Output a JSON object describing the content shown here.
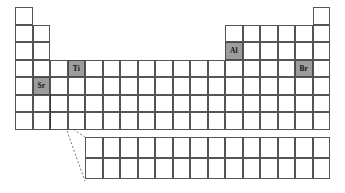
{
  "figure": {
    "kind": "periodic-table",
    "colors": {
      "highlight_fill": "#9d9d9d",
      "cell_border": "#555555",
      "cell_fill": "#ffffff",
      "label_color": "#111111",
      "connector_color": "#777777"
    }
  },
  "geometry": {
    "origin_x": 15,
    "origin_y": 7,
    "cell_w": 17.5,
    "cell_h": 17.5,
    "main_columns": 18,
    "main_rows": 7,
    "fblock_origin_x": 85,
    "fblock_origin_y": 137,
    "fblock_columns": 14,
    "fblock_rows": 2,
    "fblock_cell_w": 17.5,
    "fblock_cell_h": 21
  },
  "main_grid": {
    "rows": [
      {
        "row": 1,
        "columns": [
          1,
          18
        ]
      },
      {
        "row": 2,
        "columns": [
          1,
          2,
          13,
          14,
          15,
          16,
          17,
          18
        ]
      },
      {
        "row": 3,
        "columns": [
          1,
          2,
          13,
          14,
          15,
          16,
          17,
          18
        ]
      },
      {
        "row": 4,
        "columns": [
          1,
          2,
          3,
          4,
          5,
          6,
          7,
          8,
          9,
          10,
          11,
          12,
          13,
          14,
          15,
          16,
          17,
          18
        ]
      },
      {
        "row": 5,
        "columns": [
          1,
          2,
          3,
          4,
          5,
          6,
          7,
          8,
          9,
          10,
          11,
          12,
          13,
          14,
          15,
          16,
          17,
          18
        ]
      },
      {
        "row": 6,
        "columns": [
          1,
          2,
          3,
          4,
          5,
          6,
          7,
          8,
          9,
          10,
          11,
          12,
          13,
          14,
          15,
          16,
          17,
          18
        ]
      },
      {
        "row": 7,
        "columns": [
          1,
          2,
          3,
          4,
          5,
          6,
          7,
          8,
          9,
          10,
          11,
          12,
          13,
          14,
          15,
          16,
          17,
          18
        ]
      }
    ]
  },
  "highlighted_cells": [
    {
      "symbol": "Ti",
      "row": 4,
      "column": 4
    },
    {
      "symbol": "Sr",
      "row": 5,
      "column": 2
    },
    {
      "symbol": "Al",
      "row": 3,
      "column": 13
    },
    {
      "symbol": "Br",
      "row": 4,
      "column": 17
    }
  ],
  "fblock": {
    "rows": [
      {
        "row": 1,
        "cells": 14
      },
      {
        "row": 2,
        "cells": 14
      }
    ]
  },
  "markers": {
    "dotted_column": {
      "column": 3,
      "row_start": 6,
      "row_end": 7
    },
    "connector_lines": [
      {
        "from_x": 67,
        "from_y": 125,
        "to_x": 85,
        "to_y": 137
      },
      {
        "from_x": 67,
        "from_y": 131,
        "to_x": 85,
        "to_y": 181
      }
    ]
  }
}
